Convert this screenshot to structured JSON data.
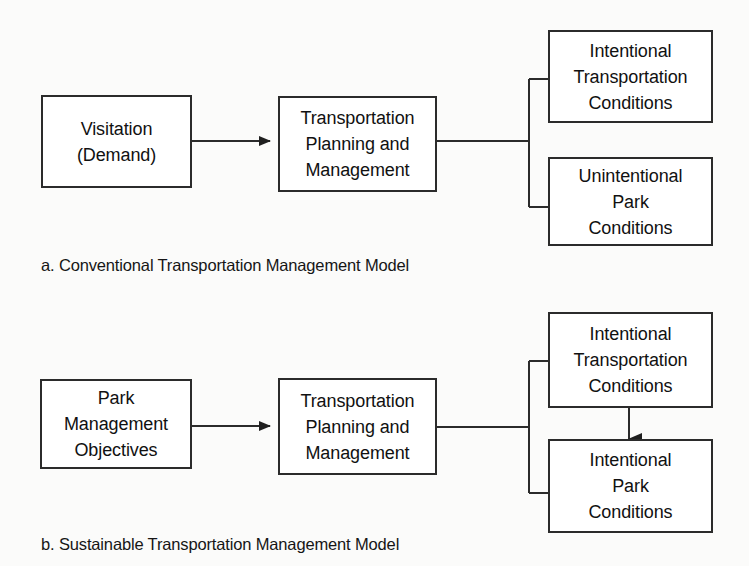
{
  "page": {
    "background_color": "#fbfbfa",
    "line_color": "#2b2b2b",
    "box_fill_color": "#ffffff",
    "text_color": "#111111"
  },
  "diagrams": [
    {
      "id": "a",
      "caption": "a. Conventional Transportation Management Model",
      "nodes": {
        "source": "Visitation\n(Demand)",
        "process": "Transportation\nPlanning and\nManagement",
        "outcome_1": "Intentional\nTransportation\nConditions",
        "outcome_2": "Unintentional\nPark\nConditions"
      },
      "connectors": {
        "source_to_process": "arrow-right",
        "process_to_outcomes": "bracket-split-right",
        "outcome_1_to_outcome_2": "none"
      }
    },
    {
      "id": "b",
      "caption": "b. Sustainable Transportation Management Model",
      "nodes": {
        "source": "Park\nManagement\nObjectives",
        "process": "Transportation\nPlanning and\nManagement",
        "outcome_1": "Intentional\nTransportation\nConditions",
        "outcome_2": "Intentional\nPark\nConditions"
      },
      "connectors": {
        "source_to_process": "arrow-right",
        "process_to_outcomes": "bracket-split-right",
        "outcome_1_to_outcome_2": "arrow-down"
      }
    }
  ]
}
